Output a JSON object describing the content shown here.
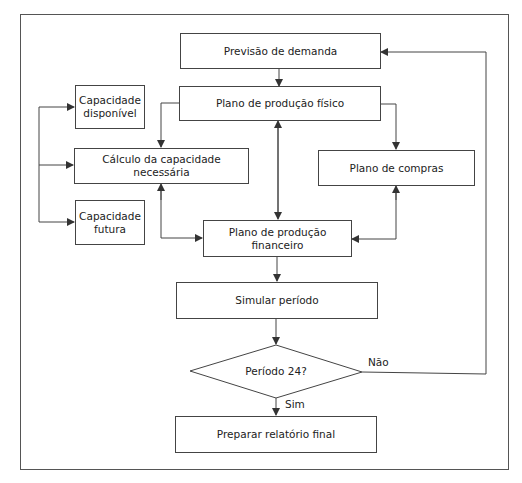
{
  "diagram": {
    "nodes": {
      "previsao": "Previsão de demanda",
      "plano_fisico": "Plano de produção físico",
      "cap_disponivel": "Capacidade disponível",
      "calculo": "Cálculo da capacidade necessária",
      "compras": "Plano de compras",
      "cap_futura": "Capacidade futura",
      "plano_financeiro": "Plano de produção financeiro",
      "simular": "Simular período",
      "decisao": "Período 24?",
      "relatorio": "Preparar relatório final"
    },
    "edge_labels": {
      "nao": "Não",
      "sim": "Sim"
    },
    "colors": {
      "line": "#444444",
      "text": "#222222",
      "background": "#ffffff"
    }
  }
}
